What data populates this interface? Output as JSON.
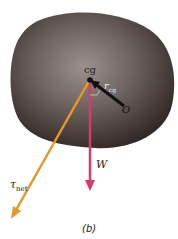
{
  "figure": {
    "caption": "(b)",
    "labels": {
      "cg": "cg",
      "r_cg": "r",
      "r_cg_sub": "cg",
      "O": "O",
      "W": "W",
      "tau": "τ",
      "tau_sub": "net"
    },
    "colors": {
      "tau_net_arrow": "#e8962a",
      "weight_arrow": "#d63a6e",
      "r_cg_arrow": "#111111",
      "body": "#4a3f3a"
    }
  }
}
